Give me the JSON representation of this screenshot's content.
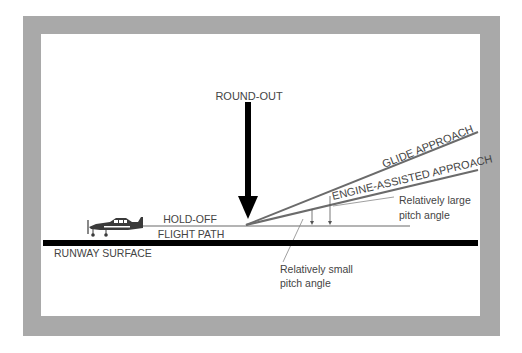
{
  "diagram": {
    "labels": {
      "round_out": "ROUND-OUT",
      "glide_approach": "GLIDE APPROACH",
      "engine_assisted_approach": "ENGINE-ASSISTED APPROACH",
      "hold_off": "HOLD-OFF",
      "flight_path": "FLIGHT PATH",
      "runway_surface": "RUNWAY SURFACE",
      "large_angle_line1": "Relatively large",
      "large_angle_line2": "pitch angle",
      "small_angle_line1": "Relatively small",
      "small_angle_line2": "pitch angle"
    },
    "colors": {
      "frame": "#a9a9a9",
      "lines": "#6b6b6b",
      "arrow": "#000000",
      "runway": "#000000",
      "text": "#444444"
    }
  }
}
